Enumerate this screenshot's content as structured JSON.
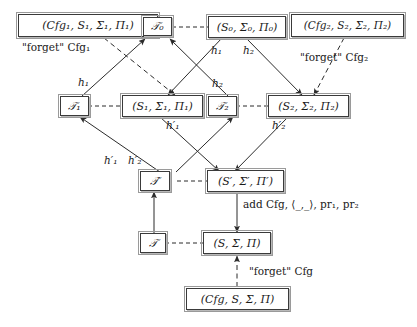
{
  "figure": {
    "kind": "commuting-diagram"
  },
  "colors": {
    "box_border": "#3a3a3a",
    "box_fill": "#ffffff",
    "edge": "#2b2b2b",
    "text": "#1a1a1a",
    "shadow": "#b9b9b9"
  },
  "nodes": {
    "cfg1": "(Cfg₁, S₁, Σ₁, Π₁)",
    "t0": "𝒯₀",
    "s0": "(S₀, Σ₀, Π₀)",
    "cfg2": "(Cfg₂, S₂, Σ₂, Π₂)",
    "t1": "𝒯₁",
    "s1": "(S₁, Σ₁, Π₁)",
    "t2": "𝒯₂",
    "s2": "(S₂, Σ₂, Π₂)",
    "tprime": "𝒯′",
    "sprime": "(S′, Σ′, Π′)",
    "t": "𝒯",
    "s": "(S, Σ, Π)",
    "cfg": "(Cfg, S, Σ, Π)"
  },
  "edge_labels": {
    "forget_cfg1": "\"forget\" Cfg₁",
    "forget_cfg2": "\"forget\" Cfg₂",
    "forget_cfg": "\"forget\" Cfg",
    "h1_left": "h₁",
    "h1_right": "h₁",
    "h2_mid": "h₂",
    "h2_right": "h₂",
    "h1p_upper": "h′₁",
    "h1p_lower": "h′₁",
    "h2p_lower": "h′₂",
    "h2p_right": "h′₂",
    "add": "add Cfg, ⟨_,_⟩, pr₁, pr₂"
  }
}
